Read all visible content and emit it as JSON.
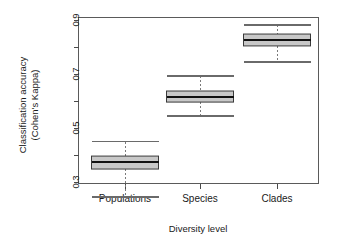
{
  "chart_data": {
    "type": "box",
    "title": "",
    "xlabel": "Diversity level",
    "ylabel_line1": "Classification accuracy",
    "ylabel_line2": "(Cohen's Kappa)",
    "categories": [
      "Populations",
      "Species",
      "Clades"
    ],
    "ylim": [
      0.22,
      0.91
    ],
    "yticks_labeled": [
      "0.3",
      "0.5",
      "0.7",
      "0.9"
    ],
    "yticks_labeled_values": [
      0.3,
      0.5,
      0.7,
      0.9
    ],
    "yticks_minor_values": [
      0.4,
      0.6,
      0.8
    ],
    "grid": false,
    "legend": "none",
    "boxes": [
      {
        "name": "Populations",
        "whisker_low": 0.244,
        "q1": 0.348,
        "median": 0.374,
        "q3": 0.396,
        "whisker_high": 0.449
      },
      {
        "name": "Species",
        "whisker_low": 0.544,
        "q1": 0.596,
        "median": 0.615,
        "q3": 0.637,
        "whisker_high": 0.693
      },
      {
        "name": "Clades",
        "whisker_low": 0.744,
        "q1": 0.804,
        "median": 0.826,
        "q3": 0.848,
        "whisker_high": 0.881
      }
    ],
    "colors": {
      "box_fill": "#c8c8c8",
      "box_border": "#3a3a3a",
      "median": "#111111",
      "whisker": "#7a7a7a",
      "axis": "#4a4a4a",
      "background": "#ffffff"
    }
  }
}
